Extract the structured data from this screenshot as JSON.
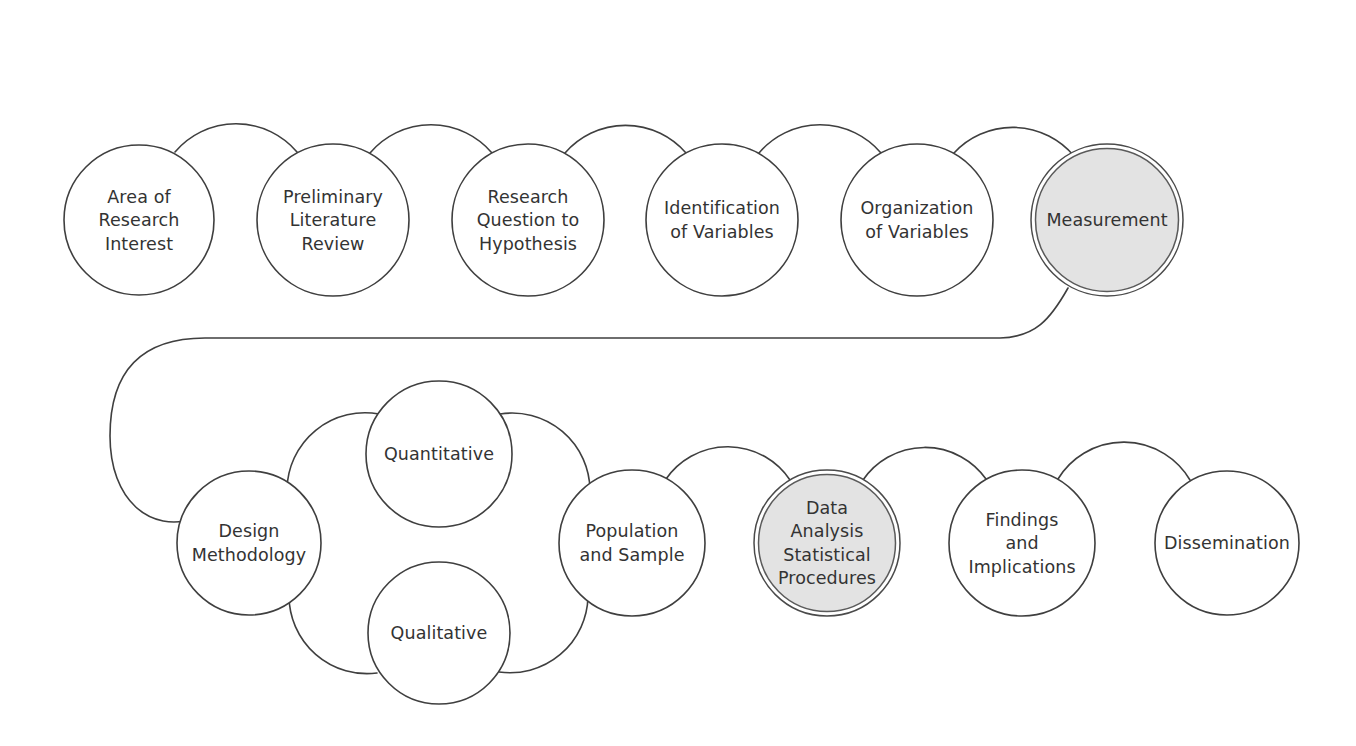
{
  "diagram": {
    "background_color": "#ffffff",
    "stroke_color": "#3f3f3f",
    "highlight_fill_color": "#e3e3e3",
    "text_color": "#333333",
    "top_row": [
      {
        "id": "area-of-research-interest",
        "lines": [
          "Area of",
          "Research",
          "Interest"
        ],
        "cx": 139,
        "cy": 220,
        "r": 75,
        "highlighted": false
      },
      {
        "id": "preliminary-literature-review",
        "lines": [
          "Preliminary",
          "Literature",
          "Review"
        ],
        "cx": 333,
        "cy": 220,
        "r": 76,
        "highlighted": false
      },
      {
        "id": "research-question-to-hypothesis",
        "lines": [
          "Research",
          "Question to",
          "Hypothesis"
        ],
        "cx": 528,
        "cy": 220,
        "r": 76,
        "highlighted": false
      },
      {
        "id": "identification-of-variables",
        "lines": [
          "Identification",
          "of Variables"
        ],
        "cx": 722,
        "cy": 220,
        "r": 76,
        "highlighted": false
      },
      {
        "id": "organization-of-variables",
        "lines": [
          "Organization",
          "of Variables"
        ],
        "cx": 917,
        "cy": 220,
        "r": 76,
        "highlighted": false
      },
      {
        "id": "measurement",
        "lines": [
          "Measurement"
        ],
        "cx": 1107,
        "cy": 220,
        "r": 76,
        "highlighted": true
      }
    ],
    "bottom_row": [
      {
        "id": "design-methodology",
        "lines": [
          "Design",
          "Methodology"
        ],
        "cx": 249,
        "cy": 543,
        "r": 72,
        "highlighted": false
      },
      {
        "id": "quantitative",
        "lines": [
          "Quantitative"
        ],
        "cx": 439,
        "cy": 454,
        "r": 73,
        "highlighted": false
      },
      {
        "id": "qualitative",
        "lines": [
          "Qualitative"
        ],
        "cx": 439,
        "cy": 633,
        "r": 71,
        "highlighted": false
      },
      {
        "id": "population-and-sample",
        "lines": [
          "Population",
          "and Sample"
        ],
        "cx": 632,
        "cy": 543,
        "r": 73,
        "highlighted": false
      },
      {
        "id": "data-analysis-statistical-procedures",
        "lines": [
          "Data",
          "Analysis",
          "Statistical",
          "Procedures"
        ],
        "cx": 827,
        "cy": 543,
        "r": 73,
        "highlighted": true
      },
      {
        "id": "findings-and-implications",
        "lines": [
          "Findings",
          "and",
          "Implications"
        ],
        "cx": 1022,
        "cy": 543,
        "r": 73,
        "highlighted": false
      },
      {
        "id": "dissemination",
        "lines": [
          "Dissemination"
        ],
        "cx": 1227,
        "cy": 543,
        "r": 72,
        "highlighted": false
      }
    ],
    "connectors": [
      {
        "id": "connector-area-to-preliminary",
        "from": "area-of-research-interest",
        "to": "preliminary-literature-review",
        "path": "M 175,152 A 80 80 0 0 1 297,152"
      },
      {
        "id": "connector-preliminary-to-question",
        "from": "preliminary-literature-review",
        "to": "research-question-to-hypothesis",
        "path": "M 370,153 A 80 80 0 0 1 492,153"
      },
      {
        "id": "connector-question-to-identification",
        "from": "research-question-to-hypothesis",
        "to": "identification-of-variables",
        "path": "M 565,153 A 80 80 0 0 1 686,153"
      },
      {
        "id": "connector-identification-to-organization",
        "from": "identification-of-variables",
        "to": "organization-of-variables",
        "path": "M 759,153 A 80 80 0 0 1 881,153"
      },
      {
        "id": "connector-organization-to-measurement",
        "from": "organization-of-variables",
        "to": "measurement",
        "path": "M 954,153 A 80 80 0 0 1 1074,156"
      },
      {
        "id": "connector-measurement-to-design",
        "from": "measurement",
        "to": "design-methodology",
        "path": "M 1068,288 C 1050,320 1035,337 1000,338 L 205,338 C 140,338 110,372 110,436 C 110,500 150,534 196,518"
      },
      {
        "id": "connector-design-to-quantitative",
        "from": "design-methodology",
        "to": "quantitative",
        "path": "M 287,489 A 78 78 0 0 1 379,414"
      },
      {
        "id": "connector-design-to-qualitative",
        "from": "design-methodology",
        "to": "qualitative",
        "path": "M 289,596 A 78 78 0 0 0 377,673"
      },
      {
        "id": "connector-quantitative-to-population",
        "from": "quantitative",
        "to": "population-and-sample",
        "path": "M 500,414 A 78 78 0 0 1 590,490"
      },
      {
        "id": "connector-qualitative-to-population",
        "from": "qualitative",
        "to": "population-and-sample",
        "path": "M 499,672 A 78 78 0 0 0 588,597"
      },
      {
        "id": "connector-population-to-data-analysis",
        "from": "population-and-sample",
        "to": "data-analysis-statistical-procedures",
        "path": "M 666,479 A 75 75 0 0 1 790,480"
      },
      {
        "id": "connector-data-analysis-to-findings",
        "from": "data-analysis-statistical-procedures",
        "to": "findings-and-implications",
        "path": "M 863,480 A 75 75 0 0 1 986,479"
      },
      {
        "id": "connector-findings-to-dissemination",
        "from": "findings-and-implications",
        "to": "dissemination",
        "path": "M 1058,479 A 77 77 0 0 1 1190,480"
      }
    ]
  }
}
